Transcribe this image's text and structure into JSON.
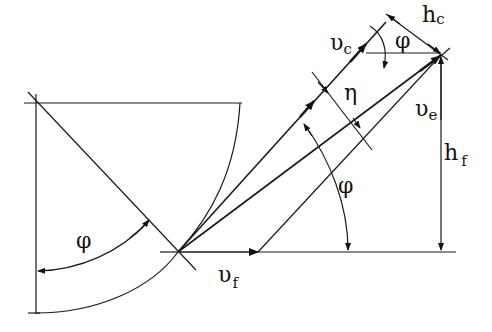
{
  "diagram": {
    "title": "",
    "labels": {
      "vc": {
        "main": "υ",
        "sub": "c"
      },
      "ve": {
        "main": "υ",
        "sub": "e"
      },
      "vf": {
        "main": "υ",
        "sub": "f"
      },
      "hc": {
        "main": "h",
        "sub": "c"
      },
      "hf": {
        "main": "h",
        "sub": "f"
      },
      "eta": "η",
      "phi_top": "φ",
      "phi_mid": "φ",
      "phi_left": "φ"
    },
    "vectors": [
      {
        "name": "cutting-velocity",
        "symbol": "υc"
      },
      {
        "name": "effective-velocity",
        "symbol": "υe"
      },
      {
        "name": "feed-velocity",
        "symbol": "υf"
      }
    ],
    "angles": [
      {
        "name": "phi",
        "symbol": "φ"
      },
      {
        "name": "eta",
        "symbol": "η"
      }
    ],
    "dimensions": [
      {
        "name": "hc",
        "symbol": "hc"
      },
      {
        "name": "hf",
        "symbol": "hf"
      }
    ]
  }
}
